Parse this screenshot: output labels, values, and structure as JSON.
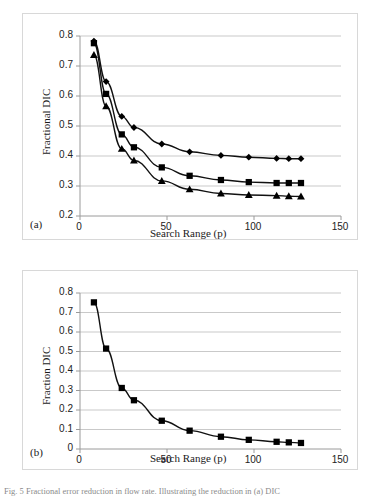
{
  "figure": {
    "caption": "Fig. 5 Fractional error reduction in flow rate. Illustrating the reduction in (a) DIC"
  },
  "panels": [
    {
      "tag": "(a)",
      "ylabel": "Fractional DIC",
      "xlabel": "Search Range (p)",
      "yticks": [
        "0.2",
        "0.3",
        "0.4",
        "0.5",
        "0.6",
        "0.7",
        "0.8"
      ],
      "xticks": [
        "0",
        "50",
        "100",
        "150"
      ]
    },
    {
      "tag": "(b)",
      "ylabel": "Fraction DIC",
      "xlabel": "Search Range (p)",
      "yticks": [
        "0",
        "0.1",
        "0.2",
        "0.3",
        "0.4",
        "0.5",
        "0.6",
        "0.7",
        "0.8"
      ],
      "xticks": [
        "0",
        "50",
        "100",
        "150"
      ]
    }
  ],
  "style": {
    "line_color": "#111111",
    "marker_color": "#000000",
    "grid_color": "#c9c9c9",
    "axis_color": "#9a9a9a",
    "frame_color": "#d8d8d8"
  },
  "chart_data": [
    {
      "type": "line",
      "title": "",
      "panel": "(a)",
      "xlabel": "Search Range (p)",
      "ylabel": "Fractional DIC",
      "xlim": [
        0,
        150
      ],
      "ylim": [
        0.2,
        0.8
      ],
      "xticks": [
        0,
        50,
        100,
        150
      ],
      "yticks": [
        0.2,
        0.3,
        0.4,
        0.5,
        0.6,
        0.7,
        0.8
      ],
      "grid": "horizontal",
      "legend": "none",
      "x": [
        8,
        15,
        24,
        31,
        47,
        63,
        81,
        97,
        113,
        120,
        127
      ],
      "series": [
        {
          "name": "series-diamond",
          "marker": "diamond",
          "values": [
            0.783,
            0.648,
            0.532,
            0.495,
            0.44,
            0.414,
            0.402,
            0.396,
            0.392,
            0.391,
            0.391
          ]
        },
        {
          "name": "series-square",
          "marker": "square",
          "values": [
            0.776,
            0.607,
            0.472,
            0.429,
            0.362,
            0.334,
            0.32,
            0.313,
            0.31,
            0.31,
            0.31
          ]
        },
        {
          "name": "series-triangle",
          "marker": "triangle",
          "values": [
            0.737,
            0.566,
            0.424,
            0.385,
            0.317,
            0.289,
            0.275,
            0.27,
            0.268,
            0.266,
            0.265
          ]
        }
      ]
    },
    {
      "type": "line",
      "title": "",
      "panel": "(b)",
      "xlabel": "Search Range (p)",
      "ylabel": "Fraction DIC",
      "xlim": [
        0,
        150
      ],
      "ylim": [
        0,
        0.8
      ],
      "xticks": [
        0,
        50,
        100,
        150
      ],
      "yticks": [
        0,
        0.1,
        0.2,
        0.3,
        0.4,
        0.5,
        0.6,
        0.7,
        0.8
      ],
      "grid": "horizontal",
      "legend": "none",
      "x": [
        8,
        15,
        24,
        31,
        47,
        63,
        81,
        97,
        113,
        120,
        127
      ],
      "series": [
        {
          "name": "series-square",
          "marker": "square",
          "values": [
            0.752,
            0.515,
            0.313,
            0.25,
            0.145,
            0.094,
            0.063,
            0.047,
            0.037,
            0.034,
            0.031
          ]
        }
      ]
    }
  ]
}
